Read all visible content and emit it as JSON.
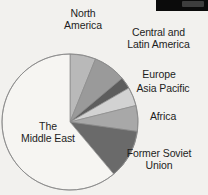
{
  "figure": {
    "title": "",
    "background_color": "#f2f1ee",
    "text_color": "#1d1d1d"
  },
  "artifact": {
    "name": "scan-artifact-block",
    "color": "#0b0b0b"
  },
  "labels": {
    "north_america": {
      "line1": "North",
      "line2": "America"
    },
    "central_latin_america": {
      "line1": "Central and",
      "line2": "Latin America"
    },
    "europe": {
      "line1": "Europe"
    },
    "asia_pacific": {
      "line1": "Asia Pacific"
    },
    "africa": {
      "line1": "Africa"
    },
    "former_soviet_union": {
      "line1": "Former Soviet",
      "line2": "Union"
    },
    "middle_east": {
      "line1": "The",
      "line2": "Middle East"
    }
  },
  "chart_data": {
    "type": "pie",
    "title": "",
    "subtitle": "",
    "xlabel": "",
    "ylabel": "",
    "legend_position": "none",
    "labels_position": "outside-callout",
    "grid": false,
    "start_angle_deg": 0,
    "direction": "clockwise",
    "center": {
      "cx": 70,
      "cy": 122
    },
    "radius": 68,
    "outline_color": "#8a8a8a",
    "categories": [
      "North America",
      "Central and Latin America",
      "Europe",
      "Asia Pacific",
      "Africa",
      "Former Soviet Union",
      "The Middle East"
    ],
    "values": [
      6.1,
      7.8,
      2.8,
      4.4,
      6.1,
      11.7,
      61.1
    ],
    "angles_deg": [
      22,
      28,
      10,
      16,
      22,
      42,
      220
    ],
    "colors": [
      "#b9b9b9",
      "#9a9a9a",
      "#5d5d5d",
      "#d2d2d2",
      "#a8a8a8",
      "#6a6a6a",
      "#f6f5f2"
    ],
    "slices": [
      {
        "name": "North America",
        "angle_deg": 22,
        "value": 6.1,
        "color": "#b9b9b9"
      },
      {
        "name": "Central and Latin America",
        "angle_deg": 28,
        "value": 7.8,
        "color": "#9a9a9a"
      },
      {
        "name": "Europe",
        "angle_deg": 10,
        "value": 2.8,
        "color": "#5d5d5d"
      },
      {
        "name": "Asia Pacific",
        "angle_deg": 16,
        "value": 4.4,
        "color": "#d2d2d2"
      },
      {
        "name": "Africa",
        "angle_deg": 22,
        "value": 6.1,
        "color": "#a8a8a8"
      },
      {
        "name": "Former Soviet Union",
        "angle_deg": 42,
        "value": 11.7,
        "color": "#6a6a6a"
      },
      {
        "name": "The Middle East",
        "angle_deg": 220,
        "value": 61.1,
        "color": "#f6f5f2"
      }
    ]
  }
}
